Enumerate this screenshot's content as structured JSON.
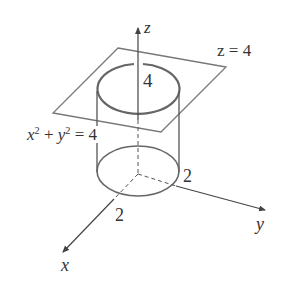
{
  "figure": {
    "axes": {
      "x_label": "x",
      "y_label": "y",
      "z_label": "z"
    },
    "plane_label": "z = 4",
    "cylinder_label": {
      "x_term": "x",
      "plus": " + ",
      "y_term": "y",
      "exp": "2",
      "equals": " = 4"
    },
    "height_label": "4",
    "x_intercept_label": "2",
    "y_intercept_label": "2",
    "colors": {
      "stroke": "#666666",
      "text": "#333333",
      "background": "#ffffff"
    }
  }
}
